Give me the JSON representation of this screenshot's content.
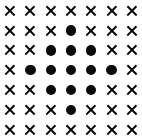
{
  "figure": {
    "name": "diamond-dot-grid",
    "background_color": "#ffffff",
    "mark_color": "#0a0a0a",
    "rows": 7,
    "columns": 7,
    "symbols": {
      "cross": "✕",
      "dot": "●"
    },
    "symbol_names": {
      "cross": "cross-mark-icon",
      "dot": "filled-dot-icon"
    }
  },
  "chart_data": {
    "type": "heatmap",
    "title": "",
    "xlabel": "",
    "ylabel": "",
    "grid": false,
    "legend": "none",
    "categories_x": [
      "1",
      "2",
      "3",
      "4",
      "5",
      "6",
      "7"
    ],
    "categories_y": [
      "1",
      "2",
      "3",
      "4",
      "5",
      "6",
      "7"
    ],
    "xlim": [
      0,
      7
    ],
    "ylim": [
      0,
      7
    ],
    "value_legend": {
      "0": "cross",
      "1": "dot"
    },
    "values": [
      [
        0,
        0,
        0,
        0,
        0,
        0,
        0
      ],
      [
        0,
        0,
        0,
        1,
        0,
        0,
        0
      ],
      [
        0,
        0,
        1,
        1,
        1,
        0,
        0
      ],
      [
        0,
        1,
        1,
        1,
        1,
        1,
        0
      ],
      [
        0,
        0,
        1,
        1,
        1,
        0,
        0
      ],
      [
        0,
        0,
        0,
        1,
        0,
        0,
        0
      ],
      [
        0,
        0,
        0,
        0,
        0,
        0,
        0
      ]
    ],
    "cells": [
      [
        "cross",
        "cross",
        "cross",
        "cross",
        "cross",
        "cross",
        "cross"
      ],
      [
        "cross",
        "cross",
        "cross",
        "dot",
        "cross",
        "cross",
        "cross"
      ],
      [
        "cross",
        "cross",
        "dot",
        "dot",
        "dot",
        "cross",
        "cross"
      ],
      [
        "cross",
        "dot",
        "dot",
        "dot",
        "dot",
        "dot",
        "cross"
      ],
      [
        "cross",
        "cross",
        "dot",
        "dot",
        "dot",
        "cross",
        "cross"
      ],
      [
        "cross",
        "cross",
        "cross",
        "dot",
        "cross",
        "cross",
        "cross"
      ],
      [
        "cross",
        "cross",
        "cross",
        "cross",
        "cross",
        "cross",
        "cross"
      ]
    ],
    "dot_count": 13,
    "cross_count": 36
  }
}
